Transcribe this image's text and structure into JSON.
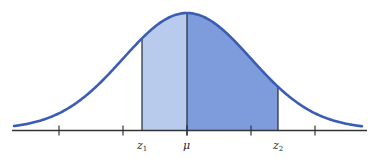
{
  "figure": {
    "colors": {
      "curve": "#3a5cb5",
      "fill_left": "#b9cbec",
      "fill_right": "#7e9cdb",
      "axis": "#333333",
      "divider": "#1f2a3a"
    },
    "geometry": {
      "mu_px": 187,
      "sigma_px": 64,
      "baseline_y": 130.5,
      "peak_y": 13,
      "axis_x_start": 12,
      "axis_x_end": 367,
      "z1_px": 142,
      "z2_px": 278,
      "tick_positions_px": [
        59,
        123,
        251,
        315
      ]
    },
    "labels": {
      "z1_main": "z",
      "z1_sub": "1",
      "mu": "μ",
      "z2_main": "z",
      "z2_sub": "2"
    }
  },
  "chart_data": {
    "type": "area",
    "title": "",
    "x_ticks_sigma": [
      -2,
      -1,
      1,
      2
    ],
    "marked_points": [
      {
        "label": "z1",
        "sigma": -0.7
      },
      {
        "label": "μ",
        "sigma": 0
      },
      {
        "label": "z2",
        "sigma": 1.41
      }
    ],
    "shaded_regions": [
      {
        "from": "z1",
        "to": "μ",
        "shade": "light"
      },
      {
        "from": "μ",
        "to": "z2",
        "shade": "dark"
      }
    ],
    "xlabel": "",
    "ylabel": "",
    "grid": false
  }
}
